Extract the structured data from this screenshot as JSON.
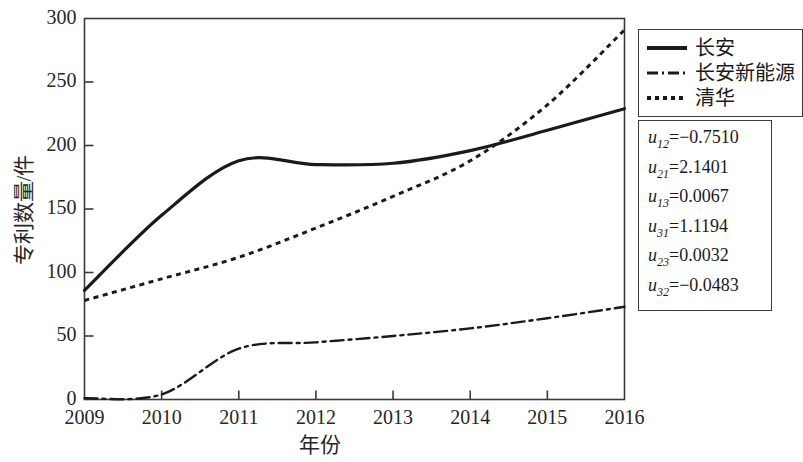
{
  "chart_data": {
    "type": "line",
    "title": "",
    "xlabel": "年份",
    "ylabel": "专利数量/件",
    "x": [
      2009,
      2010,
      2011,
      2012,
      2013,
      2014,
      2015,
      2016
    ],
    "xtick_labels": [
      "2009",
      "2010",
      "2011",
      "2012",
      "2013",
      "2014",
      "2015",
      "2016"
    ],
    "ytick_labels": [
      "0",
      "50",
      "100",
      "150",
      "200",
      "250",
      "300"
    ],
    "yticks": [
      0,
      50,
      100,
      150,
      200,
      250,
      300
    ],
    "xlim": [
      2009,
      2016
    ],
    "ylim": [
      0,
      300
    ],
    "grid": false,
    "legend_position": "outside-right-top",
    "series": [
      {
        "name": "长安",
        "style": "solid",
        "color": "#1a1a1a",
        "values": [
          86,
          145,
          188,
          185,
          186,
          196,
          212,
          229
        ]
      },
      {
        "name": "长安新能源",
        "style": "dash-dot",
        "color": "#1a1a1a",
        "values": [
          1,
          4,
          40,
          45,
          50,
          56,
          64,
          73
        ]
      },
      {
        "name": "清华",
        "style": "dotted",
        "color": "#1a1a1a",
        "values": [
          78,
          95,
          112,
          135,
          160,
          188,
          232,
          291
        ]
      }
    ],
    "annotations": [
      {
        "label": "u12",
        "sub": "12",
        "value": "=−0.7510"
      },
      {
        "label": "u21",
        "sub": "21",
        "value": "=2.1401"
      },
      {
        "label": "u13",
        "sub": "13",
        "value": "=0.0067"
      },
      {
        "label": "u31",
        "sub": "31",
        "value": "=1.1194"
      },
      {
        "label": "u23",
        "sub": "23",
        "value": "=0.0032"
      },
      {
        "label": "u32",
        "sub": "32",
        "value": "=−0.0483"
      }
    ]
  },
  "axes": {
    "y_ticks": [
      "300",
      "250",
      "200",
      "150",
      "100",
      "50",
      "0"
    ],
    "x_ticks": [
      "2009",
      "2010",
      "2011",
      "2012",
      "2013",
      "2014",
      "2015",
      "2016"
    ],
    "x_axis_title": "年份",
    "y_axis_title": "专利数量/件"
  },
  "legend": {
    "items": [
      {
        "label": "长安",
        "style": "solid"
      },
      {
        "label": "长安新能源",
        "style": "dash-dot"
      },
      {
        "label": "清华",
        "style": "dotted"
      }
    ]
  },
  "params": {
    "rows": [
      {
        "var": "u",
        "sub": "12",
        "rest": "=−0.7510"
      },
      {
        "var": "u",
        "sub": "21",
        "rest": "=2.1401"
      },
      {
        "var": "u",
        "sub": "13",
        "rest": "=0.0067"
      },
      {
        "var": "u",
        "sub": "31",
        "rest": "=1.1194"
      },
      {
        "var": "u",
        "sub": "23",
        "rest": "=0.0032"
      },
      {
        "var": "u",
        "sub": "32",
        "rest": "=−0.0483"
      }
    ]
  },
  "colors": {
    "line": "#1a1a1a",
    "axis": "#3a3a3a",
    "text": "#262626",
    "background": "#ffffff"
  }
}
